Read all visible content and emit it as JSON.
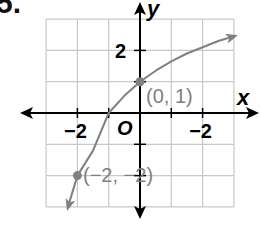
{
  "problem_number": "5.",
  "chart_data": {
    "type": "line",
    "title": "",
    "xlabel": "x",
    "ylabel": "y",
    "origin_label": "O",
    "xlim": [
      -3,
      3
    ],
    "ylim": [
      -3,
      3
    ],
    "grid": true,
    "grid_step": 1,
    "x_tick_labels": [
      {
        "value": -2,
        "label": "−2"
      },
      {
        "value": 2,
        "label": "−2"
      }
    ],
    "y_tick_labels": [
      {
        "value": 2,
        "label": "2"
      }
    ],
    "series": [
      {
        "name": "curve",
        "color": "#808080",
        "x": [
          -2.3,
          -2,
          -1.5,
          -1,
          -0.5,
          0,
          0.5,
          1,
          1.5,
          2,
          2.5,
          3
        ],
        "y": [
          -3.0,
          -2,
          -1.2,
          0,
          0.55,
          1,
          1.35,
          1.65,
          1.9,
          2.1,
          2.3,
          2.45
        ]
      }
    ],
    "points": [
      {
        "x": 0,
        "y": 1,
        "label": "(0, 1)"
      },
      {
        "x": -2,
        "y": -2,
        "label": "(−2, −2)"
      }
    ],
    "colors": {
      "grid": "#c8c8c8",
      "axis": "#000000",
      "curve": "#808080",
      "label": "#808080"
    }
  }
}
